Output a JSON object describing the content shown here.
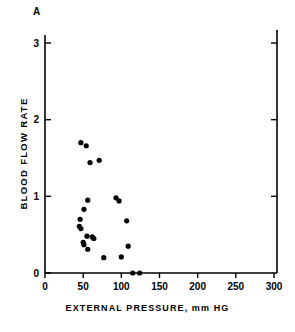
{
  "figure": {
    "panel_label": "A",
    "xlabel": "EXTERNAL PRESSURE, mm HG",
    "ylabel": "BLOOD FLOW RATE"
  },
  "axes": {
    "x_ticks": [
      "0",
      "50",
      "100",
      "150",
      "200",
      "250",
      "300"
    ],
    "y_ticks": [
      "0",
      "1",
      "2",
      "3"
    ],
    "axis_color": "#000000",
    "marker_color": "#000000"
  },
  "chart_data": {
    "type": "scatter",
    "title": "A",
    "xlabel": "EXTERNAL PRESSURE, mm HG",
    "ylabel": "BLOOD FLOW RATE",
    "xlim": [
      0,
      300
    ],
    "ylim": [
      0,
      3
    ],
    "xticks": [
      0,
      50,
      100,
      150,
      200,
      250,
      300
    ],
    "yticks": [
      0,
      1,
      2,
      3
    ],
    "grid": false,
    "legend": null,
    "marker": "filled-circle",
    "marker_color": "#000000",
    "points": [
      {
        "x": 47,
        "y": 1.7
      },
      {
        "x": 54,
        "y": 1.66
      },
      {
        "x": 59,
        "y": 1.44
      },
      {
        "x": 71,
        "y": 1.47
      },
      {
        "x": 56,
        "y": 0.95
      },
      {
        "x": 51,
        "y": 0.83
      },
      {
        "x": 46,
        "y": 0.7
      },
      {
        "x": 45,
        "y": 0.61
      },
      {
        "x": 47,
        "y": 0.58
      },
      {
        "x": 55,
        "y": 0.48
      },
      {
        "x": 62,
        "y": 0.47
      },
      {
        "x": 64,
        "y": 0.45
      },
      {
        "x": 50,
        "y": 0.4
      },
      {
        "x": 51,
        "y": 0.37
      },
      {
        "x": 56,
        "y": 0.31
      },
      {
        "x": 77,
        "y": 0.2
      },
      {
        "x": 93,
        "y": 0.98
      },
      {
        "x": 97,
        "y": 0.94
      },
      {
        "x": 107,
        "y": 0.68
      },
      {
        "x": 109,
        "y": 0.35
      },
      {
        "x": 100,
        "y": 0.21
      },
      {
        "x": 115,
        "y": 0.0
      },
      {
        "x": 124,
        "y": 0.0
      }
    ]
  }
}
